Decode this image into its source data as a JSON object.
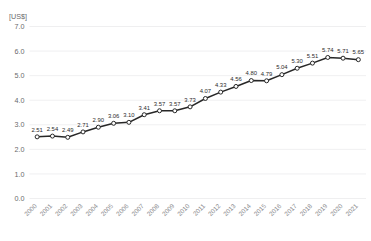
{
  "chart_data": {
    "type": "line",
    "title": "",
    "subtitle": "",
    "xlabel": "",
    "ylabel": "[US$]",
    "ylim": [
      0.0,
      7.0
    ],
    "ytick_step": 1.0,
    "yticks": [
      "0.0",
      "1.0",
      "2.0",
      "3.0",
      "4.0",
      "5.0",
      "6.0",
      "7.0"
    ],
    "grid": "horizontal",
    "legend": "none",
    "categories": [
      "2000",
      "2001",
      "2002",
      "2003",
      "2004",
      "2005",
      "2006",
      "2007",
      "2008",
      "2009",
      "2010",
      "2011",
      "2012",
      "2013",
      "2014",
      "2015",
      "2016",
      "2017",
      "2018",
      "2019",
      "2020",
      "2021"
    ],
    "values": [
      2.51,
      2.54,
      2.49,
      2.71,
      2.9,
      3.06,
      3.1,
      3.41,
      3.57,
      3.57,
      3.73,
      4.07,
      4.33,
      4.56,
      4.8,
      4.79,
      5.04,
      5.3,
      5.51,
      5.74,
      5.71,
      5.65
    ],
    "data_labels": [
      "2.51",
      "2.54",
      "2.49",
      "2.71",
      "2.90",
      "3.06",
      "3.10",
      "3.41",
      "3.57",
      "3.57",
      "3.73",
      "4.07",
      "4.33",
      "4.56",
      "4.80",
      "4.79",
      "5.04",
      "5.30",
      "5.51",
      "5.74",
      "5.71",
      "5.65"
    ],
    "colors": {
      "line": "#272727",
      "marker_fill": "#ffffff",
      "marker_stroke": "#272727",
      "grid": "#e8e8ea",
      "tick_text": "#6a6a6c",
      "xtick_text": "#8d8d90",
      "background": "#ffffff"
    },
    "xtick_rotation": -45,
    "marker": "circle",
    "show_data_labels": true
  }
}
